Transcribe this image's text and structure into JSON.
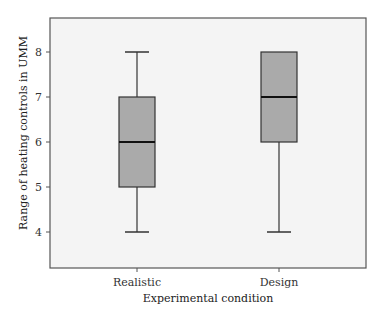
{
  "chart_data": {
    "type": "boxplot",
    "title": "",
    "xlabel": "Experimental condition",
    "ylabel": "Range of heating controls in UMM",
    "categories": [
      "Realistic",
      "Design"
    ],
    "yticks": [
      4,
      5,
      6,
      7,
      8
    ],
    "ylim": [
      3.2,
      8.8
    ],
    "grid": false,
    "legend": null,
    "series": [
      {
        "name": "Realistic",
        "whisker_low": 4,
        "q1": 5,
        "median": 6,
        "q3": 7,
        "whisker_high": 8
      },
      {
        "name": "Design",
        "whisker_low": 4,
        "q1": 6,
        "median": 7,
        "q3": 8,
        "whisker_high": 8
      }
    ],
    "colors": {
      "box_fill": "#aaaaaa",
      "box_stroke": "#333333",
      "median": "#111111",
      "plot_background": "#f4f4f4",
      "frame": "#555555"
    }
  }
}
